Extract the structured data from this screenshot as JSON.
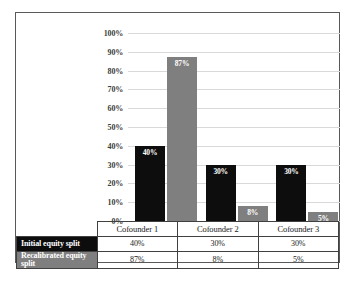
{
  "chart_data": {
    "type": "bar",
    "title": "",
    "xlabel": "",
    "ylabel": "",
    "categories": [
      "Cofounder 1",
      "Cofounder 2",
      "Cofounder 3"
    ],
    "series": [
      {
        "name": "Initial equity split",
        "values": [
          40,
          30,
          30
        ],
        "labels": [
          "40%",
          "30%",
          "30%"
        ],
        "color": "#0d0d0d"
      },
      {
        "name": "Recalibrated equity split",
        "values": [
          87,
          8,
          5
        ],
        "labels": [
          "87%",
          "8%",
          "5%"
        ],
        "color": "#7f7f7f"
      }
    ],
    "ylim": [
      0,
      100
    ],
    "ytick_labels": [
      "100%",
      "90%",
      "80%",
      "70%",
      "60%",
      "50%",
      "40%",
      "30%",
      "20%",
      "10%",
      "0%"
    ],
    "ytick_values": [
      100,
      90,
      80,
      70,
      60,
      50,
      40,
      30,
      20,
      10,
      0
    ],
    "grid": true,
    "legend": "data-table",
    "data_table": {
      "corner_label": "",
      "column_headers": [
        "Cofounder 1",
        "Cofounder 2",
        "Cofounder 3"
      ],
      "rows": [
        {
          "label": "Initial equity split",
          "cells": [
            "40%",
            "30%",
            "30%"
          ]
        },
        {
          "label": "Recalibrated equity split",
          "cells": [
            "87%",
            "8%",
            "5%"
          ]
        }
      ]
    }
  }
}
